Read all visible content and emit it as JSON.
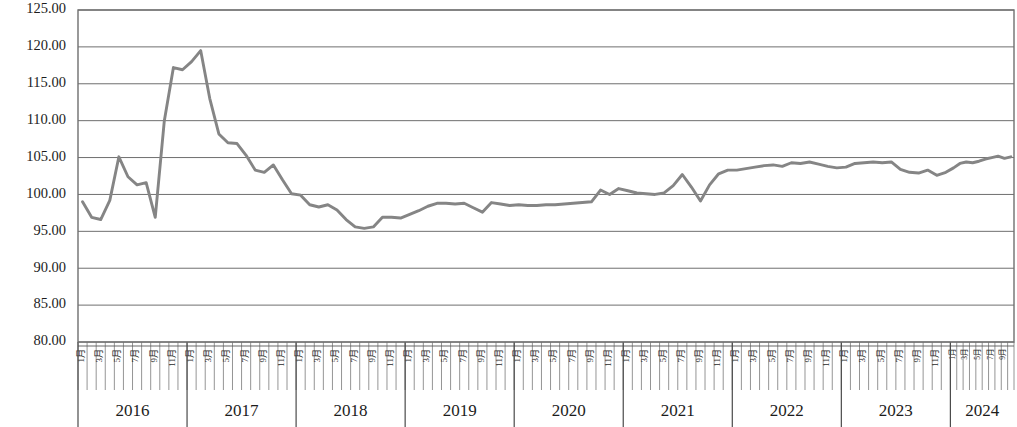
{
  "chart_data": {
    "type": "line",
    "title": "",
    "subtitle": "",
    "xlabel": "",
    "ylabel": "",
    "ylim": [
      80.0,
      125.0
    ],
    "ytick_step": 5.0,
    "ytick_labels": [
      "125.00",
      "120.00",
      "115.00",
      "110.00",
      "105.00",
      "100.00",
      "95.00",
      "90.00",
      "85.00",
      "80.00"
    ],
    "ytick_values": [
      125.0,
      120.0,
      115.0,
      110.0,
      105.0,
      100.0,
      95.0,
      90.0,
      85.0,
      80.0
    ],
    "grid": true,
    "legend": "none",
    "line_color": "#858585",
    "grid_color": "#6f6f6f",
    "axis_color": "#6f6f6f",
    "month_tick_labels": [
      "1月",
      "3月",
      "5月",
      "7月",
      "9月",
      "11月"
    ],
    "month_labels_all": [
      "1月",
      "",
      "3月",
      "",
      "5月",
      "",
      "7月",
      "",
      "9月",
      "",
      "11月",
      ""
    ],
    "year_groups": [
      {
        "year": "2016",
        "months": 12,
        "compressed": false
      },
      {
        "year": "2017",
        "months": 12,
        "compressed": false
      },
      {
        "year": "2018",
        "months": 12,
        "compressed": false
      },
      {
        "year": "2019",
        "months": 12,
        "compressed": false
      },
      {
        "year": "2020",
        "months": 12,
        "compressed": false
      },
      {
        "year": "2021",
        "months": 12,
        "compressed": false
      },
      {
        "year": "2022",
        "months": 12,
        "compressed": false
      },
      {
        "year": "2023",
        "months": 12,
        "compressed": false
      },
      {
        "year": "2024",
        "months": 10,
        "compressed": true
      }
    ],
    "series": [
      {
        "name": "指数",
        "values": [
          99.0,
          96.9,
          96.6,
          99.2,
          105.1,
          102.4,
          101.3,
          101.6,
          96.9,
          110.0,
          117.2,
          116.9,
          118.0,
          119.5,
          113.0,
          108.2,
          107.0,
          106.9,
          105.3,
          103.3,
          103.0,
          104.0,
          102.0,
          100.1,
          99.9,
          98.6,
          98.3,
          98.6,
          97.9,
          96.6,
          95.6,
          95.4,
          95.6,
          96.9,
          96.9,
          96.8,
          97.3,
          97.8,
          98.4,
          98.8,
          98.8,
          98.7,
          98.8,
          98.2,
          97.6,
          98.9,
          98.7,
          98.5,
          98.6,
          98.5,
          98.5,
          98.6,
          98.6,
          98.7,
          98.8,
          98.9,
          99.0,
          100.6,
          100.0,
          100.8,
          100.5,
          100.2,
          100.1,
          100.0,
          100.2,
          101.2,
          102.7,
          101.0,
          99.1,
          101.3,
          102.8,
          103.3,
          103.3,
          103.5,
          103.7,
          103.9,
          104.0,
          103.8,
          104.3,
          104.2,
          104.4,
          104.1,
          103.8,
          103.6,
          103.7,
          104.2,
          104.3,
          104.4,
          104.3,
          104.4,
          103.4,
          103.0,
          102.9,
          103.3,
          102.6,
          103.0,
          103.6,
          104.2,
          104.4,
          104.3,
          104.5,
          104.8,
          105.0,
          105.2,
          104.9,
          105.1
        ]
      }
    ]
  }
}
